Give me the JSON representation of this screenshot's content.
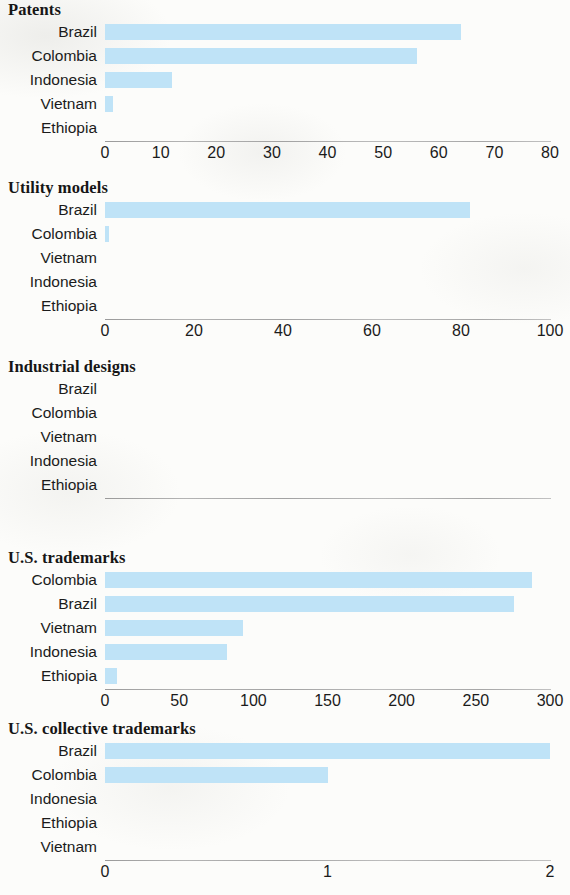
{
  "figure": {
    "bar_color": "#bfe3f7",
    "axis_color": "#a8a8a8",
    "background_color": "#fcfcfa"
  },
  "chart_data": [
    {
      "type": "bar",
      "orientation": "horizontal",
      "title": "Patents",
      "xlabel": "",
      "ylabel": "",
      "xlim": [
        0,
        80
      ],
      "grid": false,
      "legend": "none",
      "ticks": [
        "0",
        "10",
        "20",
        "30",
        "40",
        "50",
        "60",
        "70",
        "80"
      ],
      "tick_values": [
        0,
        10,
        20,
        30,
        40,
        50,
        60,
        70,
        80
      ],
      "categories": [
        "Brazil",
        "Colombia",
        "Indonesia",
        "Vietnam",
        "Ethiopia"
      ],
      "values": [
        64,
        56,
        12,
        1.5,
        0
      ]
    },
    {
      "type": "bar",
      "orientation": "horizontal",
      "title": "Utility models",
      "xlabel": "",
      "ylabel": "",
      "xlim": [
        0,
        100
      ],
      "grid": false,
      "legend": "none",
      "ticks": [
        "0",
        "20",
        "40",
        "60",
        "80",
        "100"
      ],
      "tick_values": [
        0,
        20,
        40,
        60,
        80,
        100
      ],
      "categories": [
        "Brazil",
        "Colombia",
        "Vietnam",
        "Indonesia",
        "Ethiopia"
      ],
      "values": [
        82,
        1,
        0,
        0,
        0
      ]
    },
    {
      "type": "bar",
      "orientation": "horizontal",
      "title": "Industrial designs",
      "xlabel": "",
      "ylabel": "",
      "xlim": [
        0,
        100
      ],
      "grid": false,
      "legend": "none",
      "ticks": [],
      "tick_values": [],
      "categories": [
        "Brazil",
        "Colombia",
        "Vietnam",
        "Indonesia",
        "Ethiopia"
      ],
      "values": [
        0,
        0,
        0,
        0,
        0
      ]
    },
    {
      "type": "bar",
      "orientation": "horizontal",
      "title": "U.S. trademarks",
      "xlabel": "",
      "ylabel": "",
      "xlim": [
        0,
        300
      ],
      "grid": false,
      "legend": "none",
      "ticks": [
        "0",
        "50",
        "100",
        "150",
        "200",
        "250",
        "300"
      ],
      "tick_values": [
        0,
        50,
        100,
        150,
        200,
        250,
        300
      ],
      "categories": [
        "Colombia",
        "Brazil",
        "Vietnam",
        "Indonesia",
        "Ethiopia"
      ],
      "values": [
        288,
        276,
        93,
        82,
        8
      ]
    },
    {
      "type": "bar",
      "orientation": "horizontal",
      "title": "U.S. collective trademarks",
      "xlabel": "",
      "ylabel": "",
      "xlim": [
        0,
        2
      ],
      "grid": false,
      "legend": "none",
      "ticks": [
        "0",
        "1",
        "2"
      ],
      "tick_values": [
        0,
        1,
        2
      ],
      "categories": [
        "Brazil",
        "Colombia",
        "Indonesia",
        "Ethiopia",
        "Vietnam"
      ],
      "values": [
        2,
        1,
        0,
        0,
        0
      ]
    }
  ]
}
